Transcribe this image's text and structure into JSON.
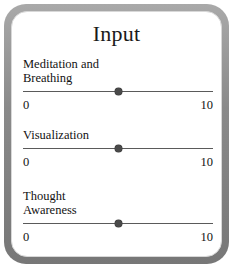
{
  "panel": {
    "title": "Input",
    "border_color": "#8a8a8a",
    "background_color": "#ffffff",
    "text_color": "#121212"
  },
  "sliders": [
    {
      "label": "Meditation and\nBreathing",
      "min_label": "0",
      "max_label": "10",
      "min": 0,
      "max": 10,
      "value": 5,
      "thumb_percent": 50
    },
    {
      "label": "Visualization",
      "min_label": "0",
      "max_label": "10",
      "min": 0,
      "max": 10,
      "value": 5,
      "thumb_percent": 50
    },
    {
      "label": "Thought\nAwareness",
      "min_label": "0",
      "max_label": "10",
      "min": 0,
      "max": 10,
      "value": 5,
      "thumb_percent": 50
    }
  ]
}
